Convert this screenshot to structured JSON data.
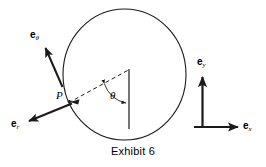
{
  "figure": {
    "caption": "Exhibit 6",
    "stroke_color": "#1a1a1a",
    "background_color": "#ffffff",
    "circle": {
      "center_x": 124.5,
      "center_y": 74.5,
      "radius_x": 61.5,
      "radius_y": 65.5
    },
    "labels": {
      "e_theta": {
        "base": "e",
        "sub": "θ"
      },
      "e_r": {
        "base": "e",
        "sub": "r"
      },
      "e_y": {
        "base": "e",
        "sub": "y"
      },
      "e_x": {
        "base": "e",
        "sub": "x"
      },
      "point_p": "P",
      "angle_theta": "θ"
    },
    "elements": {
      "radius_line_name": "vertical-radius-line",
      "dashed_line_name": "dashed-radius-to-p",
      "angle_arc_name": "angle-arc",
      "arrow_e_theta_name": "arrow-e-theta",
      "arrow_e_r_name": "arrow-e-r",
      "arrow_e_y_name": "arrow-e-y",
      "arrow_e_x_name": "arrow-e-x"
    }
  }
}
